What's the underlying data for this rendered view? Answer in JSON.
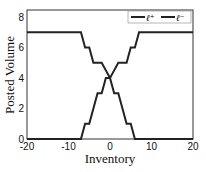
{
  "chart_data": {
    "type": "line",
    "title": "",
    "xlabel": "Inventory",
    "ylabel": "Posted Volume",
    "xlim": [
      -20,
      20
    ],
    "ylim": [
      0,
      8.5
    ],
    "xticks": [
      "-20",
      "-10",
      "0",
      "10",
      "20"
    ],
    "yticks": [
      "0",
      "2",
      "4",
      "6",
      "8"
    ],
    "grid": false,
    "legend_position": "upper right",
    "series": [
      {
        "name": "ℓ⁺",
        "color": "#222222",
        "x": [
          -20,
          -7,
          -6,
          -5,
          -4,
          -2,
          -1,
          0,
          1,
          2,
          3,
          4,
          5,
          6,
          7,
          20
        ],
        "y": [
          7,
          7,
          6,
          6,
          5,
          5,
          4.5,
          4,
          3,
          3,
          2,
          1,
          1,
          0,
          0,
          0
        ]
      },
      {
        "name": "ℓ⁻",
        "color": "#222222",
        "x": [
          -20,
          -7,
          -6,
          -5,
          -4,
          -3,
          -2,
          -1,
          0,
          1,
          2,
          4,
          5,
          6,
          7,
          20
        ],
        "y": [
          0,
          0,
          1,
          1,
          2,
          3,
          3,
          4,
          4,
          4.5,
          5,
          5,
          6,
          6,
          7,
          7
        ]
      }
    ]
  },
  "legend": {
    "item1": "ℓ⁺",
    "item2": "ℓ⁻"
  }
}
